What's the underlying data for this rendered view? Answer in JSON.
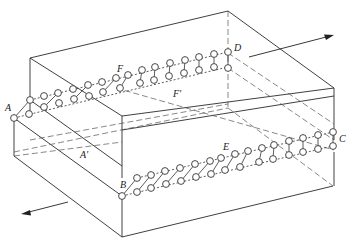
{
  "diagram": {
    "type": "isometric-block-with-molecular-chains",
    "labels": {
      "A": "A",
      "A_prime": "A'",
      "B": "B",
      "C": "C",
      "D": "D",
      "E": "E",
      "F": "F",
      "F_prime": "F'"
    },
    "arrows": [
      {
        "name": "top-arrow",
        "direction": "right"
      },
      {
        "name": "bottom-arrow",
        "direction": "left"
      }
    ],
    "chains": [
      {
        "name": "upper-chain",
        "from": "A",
        "to": "D",
        "via": "F"
      },
      {
        "name": "lower-chain",
        "from": "B",
        "to": "C",
        "via": "E"
      }
    ]
  }
}
